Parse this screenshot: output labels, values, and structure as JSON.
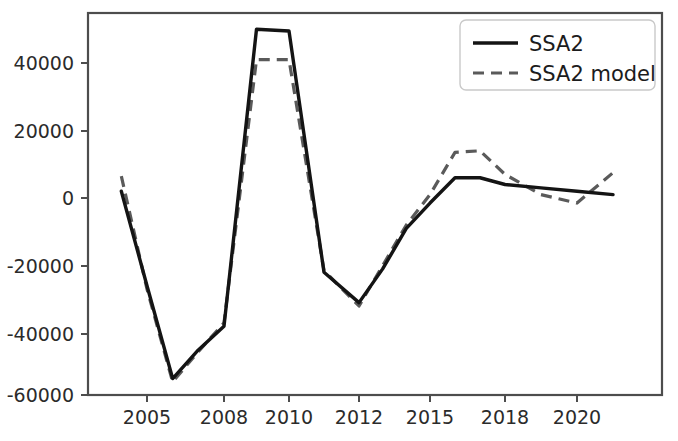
{
  "chart_data": {
    "type": "line",
    "title": "",
    "xlabel": "",
    "ylabel": "",
    "x": [
      2004,
      2005,
      2006,
      2007,
      2008,
      2009,
      2010,
      2011,
      2012,
      2013,
      2014,
      2015,
      2016,
      2017,
      2018,
      2019,
      2020,
      2021
    ],
    "xtick_labels": [
      "2005",
      "2008",
      "2010",
      "2012",
      "2015",
      "2018",
      "2020"
    ],
    "xtick_values": [
      2005,
      2008,
      2010,
      2012,
      2015,
      2018,
      2020
    ],
    "ytick_labels": [
      "40000",
      "20000",
      "0",
      "-20000",
      "-40000",
      "-60000"
    ],
    "ytick_values": [
      40000,
      20000,
      0,
      -20000,
      -40000,
      -60000
    ],
    "ylim": [
      -63000,
      55000
    ],
    "grid": false,
    "legend_position": "upper right",
    "series": [
      {
        "name": "SSA2",
        "style": "solid",
        "color": "#141414",
        "values": [
          2000,
          -26000,
          -53500,
          -45000,
          -38000,
          50000,
          49500,
          -22000,
          -31000,
          -21000,
          -9000,
          -1500,
          6000,
          6000,
          4000,
          3000,
          2000,
          1000
        ]
      },
      {
        "name": "SSA2 model",
        "style": "dashed",
        "color": "#5a5a5a",
        "values": [
          6500,
          -27000,
          -54500,
          -45500,
          -37000,
          41000,
          41000,
          -21500,
          -32000,
          -20000,
          -8000,
          1000,
          13500,
          14000,
          7000,
          1000,
          -1500,
          7500
        ]
      }
    ]
  },
  "legend": {
    "entries": [
      {
        "label": "SSA2",
        "style": "solid"
      },
      {
        "label": "SSA2 model",
        "style": "dashed"
      }
    ]
  },
  "axes": {
    "ytick_0": "40000",
    "ytick_1": "20000",
    "ytick_2": "0",
    "ytick_3": "-20000",
    "ytick_4": "-40000",
    "ytick_5": "-60000",
    "xtick_0": "2005",
    "xtick_1": "2008",
    "xtick_2": "2010",
    "xtick_3": "2012",
    "xtick_4": "2015",
    "xtick_5": "2018",
    "xtick_6": "2020"
  }
}
